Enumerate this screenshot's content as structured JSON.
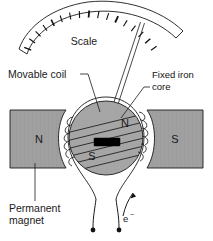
{
  "figure": {
    "name": "moving-coil-galvanometer-diagram",
    "background_color": "#ffffff",
    "ink_color": "#1a1a1a",
    "magnet_fill": "#a0a0a0",
    "core_fill": "#a6a6a6",
    "pointer_hub_color": "#000000"
  },
  "labels": {
    "scale": "Scale",
    "movable_coil": "Movable coil",
    "fixed_iron_core_line1": "Fixed iron",
    "fixed_iron_core_line2": "core",
    "permanent_magnet_line1": "Permanent",
    "permanent_magnet_line2": "magnet",
    "electron": "e",
    "electron_superscript": "−"
  },
  "poles": {
    "left_magnet": "N",
    "right_magnet": "S",
    "core_north": "N",
    "core_south": "S"
  },
  "scale_arc": {
    "tick_count": 17,
    "needle_reading_index": 11
  },
  "icons": {
    "electron_flow_arrow": "arrow-icon",
    "terminal_left": "terminal-dot-icon",
    "terminal_right": "terminal-dot-icon"
  }
}
